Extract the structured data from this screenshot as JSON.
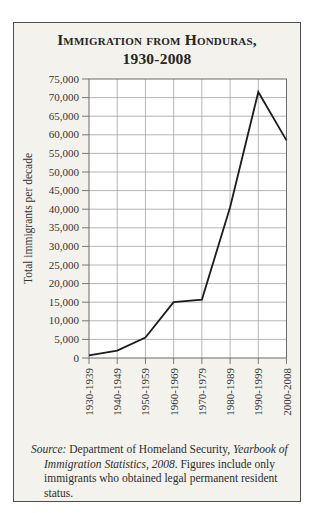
{
  "card": {
    "background": "#f3f2ec",
    "border_color": "#4d4d4d"
  },
  "title": {
    "line1": "Immigration from Honduras,",
    "line2": "1930-2008"
  },
  "chart_data": {
    "type": "line",
    "title": "Immigration from Honduras, 1930-2008",
    "categories": [
      "1930-1939",
      "1940-1949",
      "1950-1959",
      "1960-1969",
      "1970-1979",
      "1980-1989",
      "1990-1999",
      "2000-2008"
    ],
    "values": [
      700,
      2000,
      5500,
      15000,
      15700,
      40500,
      71500,
      58500
    ],
    "xlabel": "",
    "ylabel": "Total immigrants per decade",
    "ylim": [
      0,
      75000
    ],
    "ytick_step": 5000,
    "grid": true,
    "legend": "none",
    "line_color": "#1c1c1c",
    "grid_color": "#a3a3a3",
    "plot_border_color": "#6b6b6b",
    "tick_color": "#777777",
    "plot_background": "#ffffff",
    "label_color": "#333333"
  },
  "source_note": {
    "segments": [
      {
        "text": "Source:",
        "italic": true
      },
      {
        "text": " Department of Homeland Security, ",
        "italic": false
      },
      {
        "text": "Yearbook of Immigration Statistics, 2008",
        "italic": true
      },
      {
        "text": ". Figures include only immigrants who obtained legal permanent resident status.",
        "italic": false
      }
    ]
  }
}
